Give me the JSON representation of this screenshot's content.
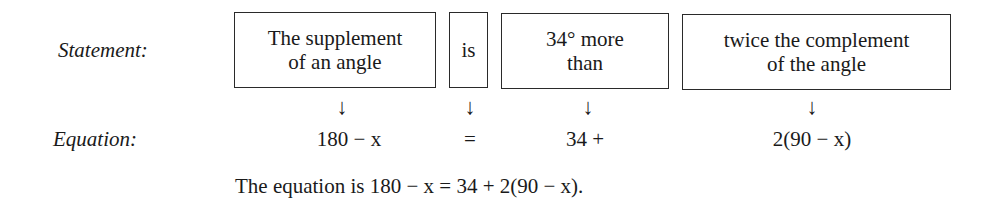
{
  "statement_label": "Statement:",
  "equation_label": "Equation:",
  "boxes": [
    {
      "text": "The supplement\nof an angle"
    },
    {
      "text": "is"
    },
    {
      "text": "34° more\nthan"
    },
    {
      "text": "twice the complement\nof the angle"
    }
  ],
  "arrow_glyph": "↓",
  "equation_parts": [
    {
      "text": "180 − x"
    },
    {
      "text": "="
    },
    {
      "text": "34 +"
    },
    {
      "text": "2(90 − x)"
    }
  ],
  "final": {
    "prefix": "The equation is ",
    "equation": "180 − x = 34 + 2(90 − x)",
    "suffix": "."
  }
}
